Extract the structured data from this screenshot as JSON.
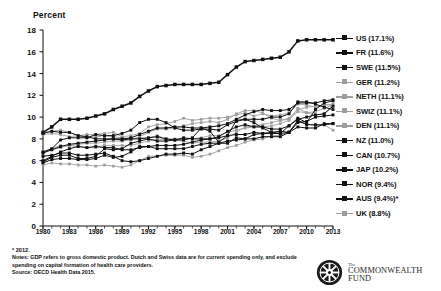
{
  "axis_title": "Percent",
  "footnotes": {
    "star": "* 2012.",
    "notes_label": "Notes:",
    "notes_line1": "GDP refers to gross domestic product. Dutch and Swiss data are for current spending only, and exclude",
    "notes_line2": "spending on capital formation of health care providers.",
    "source": "Source: OECD Health Data 2015."
  },
  "logo": {
    "the": "The",
    "name1": "COMMONWEALTH",
    "name2": "FUND"
  },
  "colors": {
    "dark": "#111111",
    "light": "#9e9e9e",
    "mid": "#6a6a6a",
    "axis": "#111111"
  },
  "chart_data": {
    "type": "line",
    "title": "",
    "xlabel": "",
    "ylabel": "Percent",
    "ylim": [
      0,
      18
    ],
    "yticks": [
      0,
      2,
      4,
      6,
      8,
      10,
      12,
      14,
      16,
      18
    ],
    "xlim": [
      1980,
      2013
    ],
    "xticks": [
      1980,
      1983,
      1986,
      1989,
      1992,
      1995,
      1998,
      2001,
      2004,
      2007,
      2010,
      2013
    ],
    "grid": false,
    "legend_position": "right",
    "x": [
      1980,
      1981,
      1982,
      1983,
      1984,
      1985,
      1986,
      1987,
      1988,
      1989,
      1990,
      1991,
      1992,
      1993,
      1994,
      1995,
      1996,
      1997,
      1998,
      1999,
      2000,
      2001,
      2002,
      2003,
      2004,
      2005,
      2006,
      2007,
      2008,
      2009,
      2010,
      2011,
      2012,
      2013
    ],
    "series": [
      {
        "name": "US",
        "legend_label": "US (17.1%)",
        "final_value": 17.1,
        "marker": "dark",
        "values": [
          8.6,
          9.1,
          9.8,
          9.8,
          9.8,
          9.9,
          10.1,
          10.3,
          10.7,
          11.0,
          11.3,
          11.9,
          12.4,
          12.8,
          12.9,
          13.0,
          13.0,
          13.0,
          13.0,
          13.1,
          13.2,
          13.9,
          14.6,
          15.1,
          15.2,
          15.3,
          15.4,
          15.5,
          16.0,
          17.0,
          17.1,
          17.1,
          17.1,
          17.1
        ]
      },
      {
        "name": "FR",
        "legend_label": "FR (11.6%)",
        "final_value": 11.6,
        "marker": "dark",
        "values": [
          6.7,
          7.0,
          7.3,
          7.5,
          7.6,
          7.7,
          7.8,
          7.9,
          8.0,
          8.0,
          8.1,
          8.4,
          8.7,
          9.0,
          9.0,
          9.1,
          9.1,
          9.0,
          9.0,
          9.1,
          9.2,
          9.4,
          9.8,
          10.2,
          10.5,
          10.7,
          10.6,
          10.6,
          10.7,
          11.3,
          11.3,
          11.3,
          11.5,
          11.6
        ]
      },
      {
        "name": "SWE",
        "legend_label": "SWE (11.5%)",
        "final_value": 11.5,
        "marker": "dark",
        "values": [
          8.5,
          8.7,
          8.6,
          8.6,
          8.3,
          8.2,
          8.0,
          8.0,
          8.0,
          7.9,
          8.0,
          8.0,
          8.1,
          8.2,
          8.0,
          7.9,
          8.1,
          8.0,
          8.0,
          8.0,
          8.2,
          8.7,
          9.1,
          9.3,
          9.1,
          9.1,
          8.9,
          8.9,
          9.2,
          9.9,
          9.5,
          10.7,
          11.3,
          11.5
        ]
      },
      {
        "name": "GER",
        "legend_label": "GER (11.2%)",
        "final_value": 11.2,
        "marker": "light",
        "values": [
          8.4,
          8.5,
          8.4,
          8.2,
          8.3,
          8.4,
          8.4,
          8.5,
          8.6,
          8.2,
          8.3,
          8.5,
          9.1,
          9.3,
          9.4,
          9.6,
          9.9,
          9.7,
          9.8,
          9.9,
          9.9,
          10.0,
          10.2,
          10.4,
          10.1,
          10.3,
          10.1,
          10.2,
          10.4,
          11.2,
          11.1,
          10.9,
          11.1,
          11.2
        ]
      },
      {
        "name": "NETH",
        "legend_label": "NETH (11.1%)",
        "final_value": 11.1,
        "marker": "light",
        "values": [
          6.8,
          7.1,
          7.4,
          7.4,
          7.3,
          7.2,
          7.2,
          7.4,
          7.4,
          7.4,
          7.4,
          7.6,
          7.8,
          8.0,
          7.9,
          7.9,
          7.8,
          7.6,
          7.7,
          7.7,
          7.8,
          8.1,
          8.6,
          9.1,
          9.2,
          9.3,
          9.5,
          9.7,
          9.9,
          10.7,
          10.9,
          11.0,
          11.1,
          11.1
        ]
      },
      {
        "name": "SWIZ",
        "legend_label": "SWIZ (11.1%)",
        "final_value": 11.1,
        "marker": "light",
        "values": [
          6.8,
          7.0,
          7.2,
          7.4,
          7.5,
          7.6,
          7.6,
          7.7,
          7.8,
          7.8,
          7.9,
          8.2,
          8.6,
          8.9,
          8.9,
          9.0,
          9.2,
          9.4,
          9.5,
          9.6,
          9.5,
          9.8,
          10.3,
          10.6,
          10.6,
          10.4,
          9.9,
          9.7,
          9.8,
          10.5,
          10.4,
          10.5,
          10.8,
          11.1
        ]
      },
      {
        "name": "DEN",
        "legend_label": "DEN (11.1%)",
        "final_value": 11.1,
        "marker": "light",
        "values": [
          8.6,
          8.7,
          8.8,
          8.6,
          8.3,
          8.1,
          8.2,
          8.3,
          8.2,
          8.1,
          8.0,
          8.1,
          8.1,
          8.3,
          8.0,
          8.0,
          8.0,
          8.0,
          8.1,
          8.3,
          8.3,
          8.6,
          8.8,
          9.0,
          9.1,
          9.1,
          9.2,
          9.4,
          9.7,
          10.8,
          10.4,
          10.2,
          10.3,
          11.1
        ]
      },
      {
        "name": "NZ",
        "legend_label": "NZ (11.0%)",
        "final_value": 11.0,
        "marker": "dark",
        "values": [
          5.8,
          6.1,
          6.2,
          6.2,
          6.1,
          6.1,
          6.2,
          6.5,
          6.3,
          6.4,
          6.8,
          7.3,
          7.3,
          7.1,
          7.1,
          7.1,
          7.1,
          7.3,
          7.5,
          7.6,
          7.6,
          7.6,
          8.1,
          8.0,
          8.4,
          8.5,
          8.6,
          8.5,
          9.2,
          9.8,
          10.0,
          10.2,
          10.3,
          11.0
        ]
      },
      {
        "name": "CAN",
        "legend_label": "CAN (10.7%)",
        "final_value": 10.7,
        "marker": "dark",
        "values": [
          6.8,
          7.1,
          7.9,
          8.1,
          8.1,
          8.1,
          8.4,
          8.3,
          8.3,
          8.5,
          8.8,
          9.5,
          9.8,
          9.8,
          9.5,
          9.0,
          8.8,
          8.8,
          8.9,
          8.9,
          8.8,
          9.3,
          9.6,
          9.8,
          9.8,
          9.8,
          10.0,
          10.0,
          10.3,
          11.4,
          11.4,
          11.2,
          10.9,
          10.7
        ]
      },
      {
        "name": "JAP",
        "legend_label": "JAP (10.2%)",
        "final_value": 10.2,
        "marker": "dark",
        "values": [
          6.4,
          6.5,
          6.7,
          6.7,
          6.5,
          6.5,
          6.6,
          6.7,
          6.4,
          6.0,
          5.9,
          6.0,
          6.2,
          6.4,
          6.6,
          6.6,
          6.7,
          6.6,
          7.0,
          7.3,
          7.6,
          7.8,
          7.9,
          8.0,
          8.0,
          8.2,
          8.2,
          8.2,
          8.6,
          9.5,
          9.6,
          10.0,
          10.1,
          10.2
        ]
      },
      {
        "name": "NOR",
        "legend_label": "NOR (9.4%)",
        "final_value": 9.4,
        "marker": "dark",
        "values": [
          5.9,
          6.3,
          6.5,
          6.5,
          6.2,
          6.2,
          6.4,
          7.1,
          7.0,
          7.1,
          7.6,
          7.8,
          8.0,
          7.8,
          7.8,
          7.9,
          7.9,
          8.1,
          9.0,
          8.7,
          7.7,
          8.3,
          9.7,
          9.8,
          9.5,
          9.0,
          8.6,
          8.7,
          8.6,
          9.7,
          9.3,
          9.3,
          9.3,
          9.4
        ]
      },
      {
        "name": "AUS",
        "legend_label": "AUS (9.4%)*",
        "final_value": 9.4,
        "marker": "dark",
        "values": [
          6.0,
          6.4,
          6.8,
          7.1,
          7.3,
          7.2,
          7.3,
          7.2,
          7.2,
          7.0,
          7.0,
          7.2,
          7.3,
          7.4,
          7.4,
          7.4,
          7.5,
          7.7,
          7.9,
          8.0,
          8.1,
          8.3,
          8.4,
          8.4,
          8.6,
          8.5,
          8.5,
          8.5,
          8.6,
          9.1,
          9.0,
          9.0,
          9.4,
          9.4
        ]
      },
      {
        "name": "UK",
        "legend_label": "UK (8.8%)",
        "final_value": 8.8,
        "marker": "light",
        "values": [
          5.6,
          5.8,
          5.7,
          5.7,
          5.6,
          5.6,
          5.5,
          5.6,
          5.5,
          5.4,
          5.6,
          6.0,
          6.4,
          6.4,
          6.5,
          6.5,
          6.5,
          6.3,
          6.4,
          6.6,
          6.9,
          7.2,
          7.4,
          7.7,
          7.9,
          8.0,
          8.3,
          8.3,
          8.7,
          9.6,
          9.4,
          9.2,
          9.3,
          8.8
        ]
      }
    ]
  }
}
